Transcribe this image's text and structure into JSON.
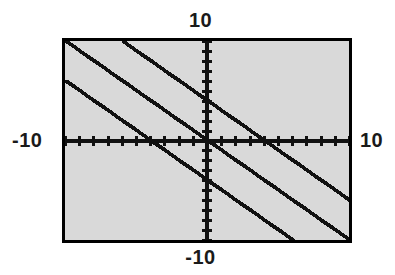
{
  "figure": {
    "background_color": "#ffffff",
    "plot_background_color": "#d9d9d9",
    "border_color": "#000000",
    "ink_color": "#111111"
  },
  "labels": {
    "top": "10",
    "bottom": "-10",
    "left": "-10",
    "right": "10"
  },
  "chart_data": {
    "type": "line",
    "title": "",
    "xlabel": "",
    "ylabel": "",
    "xlim": [
      -10,
      10
    ],
    "ylim": [
      -10,
      10
    ],
    "grid": false,
    "legend": "none",
    "axis_style": "centered-crosshair-with-ticks",
    "tick_interval_x": 1,
    "tick_interval_y": 1,
    "x_tick_labels": [
      "-10",
      "10"
    ],
    "y_tick_labels": [
      "-10",
      "10"
    ],
    "line_style": "dotted-pixelated",
    "series": [
      {
        "name": "y = -x - 4",
        "slope": -1,
        "intercept": -4,
        "x": [
          -10,
          10
        ],
        "y": [
          6,
          -14
        ],
        "x_intercept": -4,
        "y_intercept": -4
      },
      {
        "name": "y = -x",
        "slope": -1,
        "intercept": 0,
        "x": [
          -10,
          10
        ],
        "y": [
          10,
          -10
        ],
        "x_intercept": 0,
        "y_intercept": 0
      },
      {
        "name": "y = -x + 4",
        "slope": -1,
        "intercept": 4,
        "x": [
          -10,
          10
        ],
        "y": [
          14,
          -6
        ],
        "x_intercept": 4,
        "y_intercept": 4
      }
    ]
  }
}
